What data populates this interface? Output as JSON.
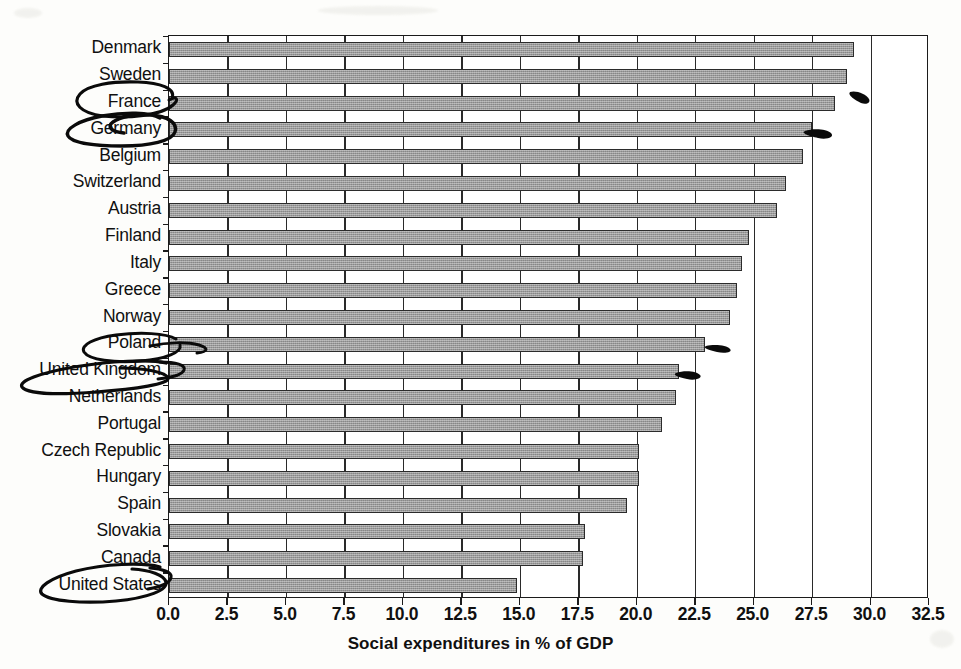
{
  "chart_data": {
    "type": "bar",
    "orientation": "horizontal",
    "title": "",
    "xlabel": "Social expenditures in % of GDP",
    "ylabel": "",
    "xlim": [
      0.0,
      32.5
    ],
    "xticks": [
      "0.0",
      "2.5",
      "5.0",
      "7.5",
      "10.0",
      "12.5",
      "15.0",
      "17.5",
      "20.0",
      "22.5",
      "25.0",
      "27.5",
      "30.0",
      "32.5"
    ],
    "xtick_values": [
      0.0,
      2.5,
      5.0,
      7.5,
      10.0,
      12.5,
      15.0,
      17.5,
      20.0,
      22.5,
      25.0,
      27.5,
      30.0,
      32.5
    ],
    "grid": "vertical",
    "legend": "none",
    "bar_color": "#9a9a9a",
    "bar_edge_color": "#2b2b2b",
    "categories": [
      "Denmark",
      "Sweden",
      "France",
      "Germany",
      "Belgium",
      "Switzerland",
      "Austria",
      "Finland",
      "Italy",
      "Greece",
      "Norway",
      "Poland",
      "United Kingdom",
      "Netherlands",
      "Portugal",
      "Czech Republic",
      "Hungary",
      "Spain",
      "Slovakia",
      "Canada",
      "United States"
    ],
    "values": [
      29.3,
      29.0,
      28.5,
      27.5,
      27.1,
      26.4,
      26.0,
      24.8,
      24.5,
      24.3,
      24.0,
      22.9,
      21.8,
      21.7,
      21.1,
      20.1,
      20.1,
      19.6,
      17.8,
      17.7,
      14.9
    ]
  },
  "annotations": {
    "circled_countries": [
      "France",
      "Germany",
      "Poland",
      "United Kingdom",
      "United States"
    ],
    "tick_marks": [
      "France",
      "Germany",
      "Poland",
      "United Kingdom"
    ],
    "ink_color": "#0a0a0a",
    "style": "handwritten-pen-oval"
  }
}
